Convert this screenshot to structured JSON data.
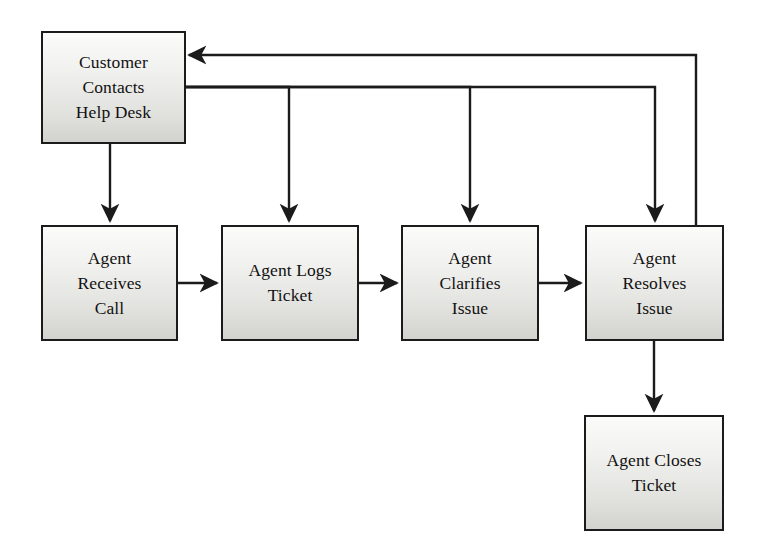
{
  "diagram": {
    "type": "flowchart",
    "background_color": "#ffffff",
    "line_color": "#1b1b1b",
    "node_fill_top": "#fbfbfa",
    "node_fill_bottom": "#d2d2cf",
    "node_border_color": "#1b1b1b",
    "nodes": [
      {
        "id": "customer-contacts-help-desk",
        "label": "Customer\nContacts\nHelp Desk",
        "x": 41,
        "y": 31,
        "w": 145,
        "h": 113
      },
      {
        "id": "agent-receives-call",
        "label": "Agent\nReceives\nCall",
        "x": 41,
        "y": 225,
        "w": 137,
        "h": 116
      },
      {
        "id": "agent-logs-ticket",
        "label": "Agent Logs\nTicket",
        "x": 221,
        "y": 225,
        "w": 138,
        "h": 116
      },
      {
        "id": "agent-clarifies-issue",
        "label": "Agent\nClarifies\nIssue",
        "x": 401,
        "y": 225,
        "w": 138,
        "h": 116
      },
      {
        "id": "agent-resolves-issue",
        "label": "Agent\nResolves\nIssue",
        "x": 585,
        "y": 225,
        "w": 139,
        "h": 116
      },
      {
        "id": "agent-closes-ticket",
        "label": "Agent Closes\nTicket",
        "x": 584,
        "y": 415,
        "w": 140,
        "h": 116
      }
    ],
    "edges": [
      {
        "id": "edge-customer-to-receives",
        "from": "customer-contacts-help-desk",
        "to": "agent-receives-call",
        "arrow": "down",
        "points": "110,144 110,221"
      },
      {
        "id": "edge-receives-to-logs",
        "from": "agent-receives-call",
        "to": "agent-logs-ticket",
        "arrow": "right",
        "points": "178,283 217,283"
      },
      {
        "id": "edge-logs-to-clarifies",
        "from": "agent-logs-ticket",
        "to": "agent-clarifies-issue",
        "arrow": "right",
        "points": "359,283 397,283"
      },
      {
        "id": "edge-clarifies-to-resolves",
        "from": "agent-clarifies-issue",
        "to": "agent-resolves-issue",
        "arrow": "right",
        "points": "539,283 581,283"
      },
      {
        "id": "edge-resolves-to-closes",
        "from": "agent-resolves-issue",
        "to": "agent-closes-ticket",
        "arrow": "down",
        "points": "654,341 654,411"
      },
      {
        "id": "edge-resolves-back-to-customer",
        "from": "agent-resolves-issue",
        "to": "customer-contacts-help-desk",
        "arrow": "left",
        "points": "696,225 696,55 189,55"
      },
      {
        "id": "edge-customer-to-logs",
        "from": "customer-contacts-help-desk",
        "to": "agent-logs-ticket",
        "arrow": "down",
        "points": "186,87 289,87 289,221"
      },
      {
        "id": "edge-customer-to-clarifies",
        "from": "customer-contacts-help-desk",
        "to": "agent-clarifies-issue",
        "arrow": "down",
        "points": "186,87 470,87 470,221"
      },
      {
        "id": "edge-customer-to-resolves",
        "from": "customer-contacts-help-desk",
        "to": "agent-resolves-issue",
        "arrow": "down",
        "points": "186,87 655,87 655,221"
      }
    ]
  }
}
